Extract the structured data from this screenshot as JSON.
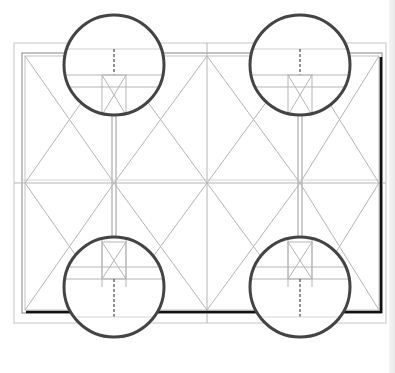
{
  "diagram": {
    "caption_clipped": "",
    "panels": {
      "columns": 4,
      "rows": 2,
      "cross_bracing": "X in every panel"
    },
    "callouts": [
      {
        "name": "top-left-joint",
        "position": "top-left",
        "detail": "mullion head joint"
      },
      {
        "name": "top-right-joint",
        "position": "top-right",
        "detail": "mullion head joint"
      },
      {
        "name": "bottom-left-joint",
        "position": "bottom-left",
        "detail": "mullion sill joint"
      },
      {
        "name": "bottom-right-joint",
        "position": "bottom-right",
        "detail": "mullion sill joint"
      }
    ],
    "colors": {
      "thin_line": "#b5b5b5",
      "frame_line": "#9a9a9a",
      "heavy_edge": "#111111",
      "callout_ring": "#444444",
      "dashed_line": "#555555"
    }
  }
}
